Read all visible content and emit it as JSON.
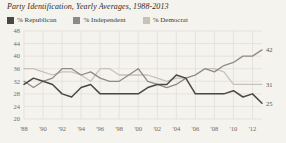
{
  "chart_data": {
    "type": "line",
    "title": "Party Identification, Yearly Averages, 1988-2013",
    "xlabel": "",
    "ylabel": "",
    "ylim": [
      20,
      48
    ],
    "ytick_step": 4,
    "yticks": [
      "48",
      "44",
      "40",
      "36",
      "32",
      "28",
      "24",
      "20"
    ],
    "grid": true,
    "legend_position": "top-left",
    "x": [
      1988,
      1989,
      1990,
      1991,
      1992,
      1993,
      1994,
      1995,
      1996,
      1997,
      1998,
      1999,
      2000,
      2001,
      2002,
      2003,
      2004,
      2005,
      2006,
      2007,
      2008,
      2009,
      2010,
      2011,
      2012,
      2013
    ],
    "xticks": [
      "'88",
      "'90",
      "'92",
      "'94",
      "'96",
      "'98",
      "'00",
      "'02",
      "'04",
      "'06",
      "'08",
      "'10",
      "'12"
    ],
    "series": [
      {
        "name": "% Republican",
        "color": "#4a4843",
        "end_label": "25",
        "values": [
          31,
          33,
          32,
          31,
          28,
          27,
          30,
          31,
          28,
          28,
          28,
          28,
          28,
          30,
          31,
          31,
          34,
          33,
          28,
          28,
          28,
          28,
          29,
          27,
          28,
          25
        ]
      },
      {
        "name": "% Independent",
        "color": "#8e8b84",
        "end_label": "42",
        "values": [
          32,
          30,
          32,
          33,
          36,
          36,
          34,
          35,
          33,
          32,
          32,
          34,
          36,
          32,
          31,
          30,
          31,
          33,
          34,
          36,
          35,
          37,
          38,
          40,
          40,
          42
        ]
      },
      {
        "name": "% Democrat",
        "color": "#c6c2b9",
        "end_label": "31",
        "values": [
          36,
          36,
          35,
          34,
          35,
          35,
          34,
          32,
          36,
          36,
          34,
          34,
          34,
          34,
          33,
          32,
          33,
          33,
          34,
          36,
          36,
          35,
          31,
          31,
          31,
          31
        ]
      }
    ]
  }
}
